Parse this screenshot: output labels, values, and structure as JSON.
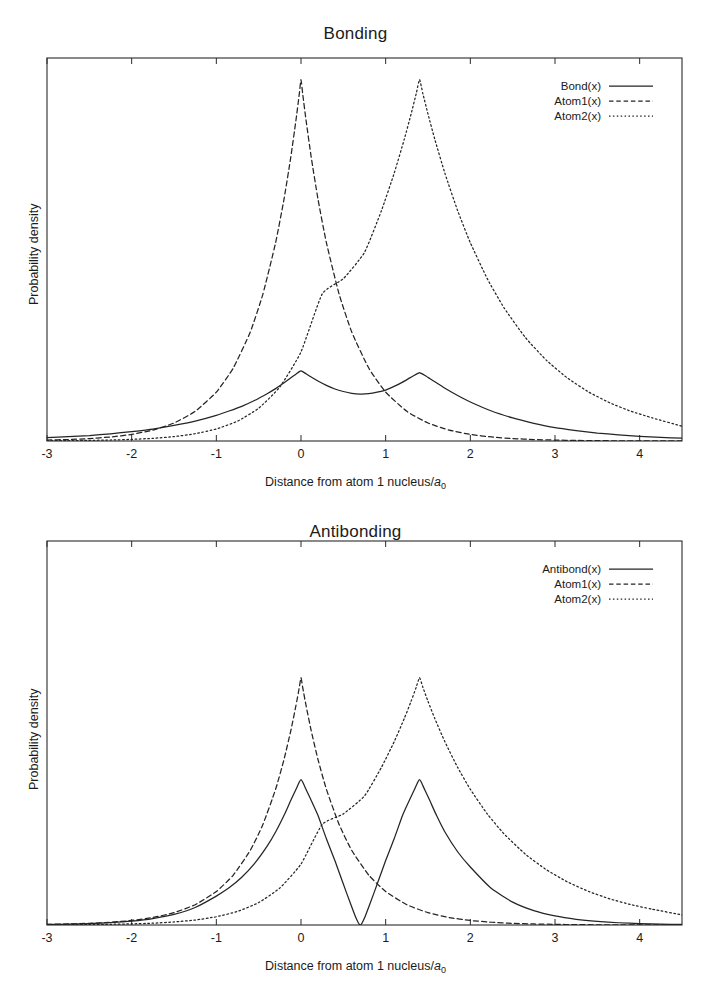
{
  "figures": [
    {
      "id": "bonding",
      "title": "Bonding",
      "xlabel_main": "Distance from atom 1 nucleus/",
      "xlabel_sym": "a",
      "xlabel_subscript": "0",
      "ylabel": "Probability density",
      "legend": [
        {
          "label": "Bond(x)",
          "style": "solid"
        },
        {
          "label": "Atom1(x)",
          "style": "dashed"
        },
        {
          "label": "Atom2(x)",
          "style": "dotted"
        }
      ]
    },
    {
      "id": "antibonding",
      "title": "Antibonding",
      "xlabel_main": "Distance from atom 1 nucleus/",
      "xlabel_sym": "a",
      "xlabel_subscript": "0",
      "ylabel": "Probability density",
      "legend": [
        {
          "label": "Antibond(x)",
          "style": "solid"
        },
        {
          "label": "Atom1(x)",
          "style": "dashed"
        },
        {
          "label": "Atom2(x)",
          "style": "dotted"
        }
      ]
    }
  ],
  "chart_data": [
    {
      "type": "line",
      "id": "bonding",
      "title": "Bonding",
      "xlabel": "Distance from atom 1 nucleus/a0",
      "ylabel": "Probability density",
      "grid": false,
      "legend_position": "top-right",
      "xlim": [
        -3.0,
        4.5
      ],
      "ylim": [
        0.0,
        1.06
      ],
      "xticks": [
        -3,
        -2,
        -1,
        0,
        1,
        2,
        3,
        4
      ],
      "xticklabels": [
        "-3",
        "-2",
        "-1",
        "0",
        "1",
        "2",
        "3",
        "4"
      ],
      "yticks": [],
      "yticklabels": [],
      "nucleus_positions": [
        0.0,
        1.4
      ],
      "decay_length_a0": 1.0,
      "description": "Squared sum of two 1s orbitals (bonding MO) compared with the individual atomic probability densities. Atom1 peaks at x=0, Atom2 peaks at x=1.4. The bonding curve shows two rounded maxima near the nuclei with filled-in electron density in the internuclear region (no node).",
      "series": [
        {
          "name": "Bond(x)",
          "style": "solid",
          "x": [
            -3.0,
            -2.75,
            -2.5,
            -2.25,
            -2.0,
            -1.75,
            -1.5,
            -1.25,
            -1.0,
            -0.85,
            -0.7,
            -0.55,
            -0.4,
            -0.3,
            -0.2,
            -0.12,
            -0.06,
            -0.02,
            0.0,
            0.02,
            0.06,
            0.12,
            0.2,
            0.3,
            0.4,
            0.5,
            0.6,
            0.7,
            0.8,
            0.9,
            1.0,
            1.1,
            1.2,
            1.28,
            1.34,
            1.38,
            1.4,
            1.42,
            1.46,
            1.52,
            1.6,
            1.7,
            1.85,
            2.0,
            2.25,
            2.5,
            2.75,
            3.0,
            3.25,
            3.5,
            3.75,
            4.0,
            4.25,
            4.5
          ],
          "y": [
            0.009,
            0.012,
            0.015,
            0.02,
            0.026,
            0.033,
            0.043,
            0.055,
            0.071,
            0.083,
            0.096,
            0.112,
            0.131,
            0.145,
            0.161,
            0.175,
            0.185,
            0.192,
            0.194,
            0.192,
            0.186,
            0.177,
            0.166,
            0.154,
            0.144,
            0.137,
            0.132,
            0.13,
            0.131,
            0.135,
            0.141,
            0.151,
            0.163,
            0.174,
            0.182,
            0.187,
            0.189,
            0.187,
            0.182,
            0.173,
            0.161,
            0.146,
            0.126,
            0.108,
            0.083,
            0.064,
            0.049,
            0.037,
            0.029,
            0.022,
            0.017,
            0.013,
            0.01,
            0.008
          ]
        },
        {
          "name": "Atom1(x)",
          "style": "dashed",
          "x": [
            -3.0,
            -2.75,
            -2.5,
            -2.25,
            -2.0,
            -1.75,
            -1.5,
            -1.25,
            -1.0,
            -0.8,
            -0.6,
            -0.45,
            -0.3,
            -0.2,
            -0.12,
            -0.06,
            -0.02,
            0.0,
            0.02,
            0.06,
            0.12,
            0.2,
            0.3,
            0.45,
            0.6,
            0.8,
            1.0,
            1.25,
            1.5,
            1.75,
            2.0,
            2.25,
            2.5,
            2.75,
            3.0,
            3.25,
            3.5,
            3.75,
            4.0,
            4.25,
            4.5
          ],
          "y": [
            0.0025,
            0.0041,
            0.0067,
            0.0111,
            0.0183,
            0.0302,
            0.0498,
            0.0821,
            0.1353,
            0.2019,
            0.3012,
            0.4066,
            0.5488,
            0.6703,
            0.7866,
            0.8869,
            0.9608,
            1.0,
            0.9608,
            0.8869,
            0.7866,
            0.6703,
            0.5488,
            0.4066,
            0.3012,
            0.2019,
            0.1353,
            0.0821,
            0.0498,
            0.0302,
            0.0183,
            0.0111,
            0.0067,
            0.0041,
            0.0025,
            0.0015,
            0.0009,
            0.0006,
            0.0003,
            0.0002,
            0.0001
          ]
        },
        {
          "name": "Atom2(x)",
          "style": "dotted",
          "x": [
            -3.0,
            -2.75,
            -2.5,
            -2.25,
            -2.0,
            -1.75,
            -1.5,
            -1.25,
            -1.0,
            -0.75,
            -0.5,
            -0.25,
            0.0,
            0.25,
            0.5,
            0.75,
            0.95,
            1.1,
            1.22,
            1.3,
            1.36,
            1.4,
            1.44,
            1.5,
            1.58,
            1.7,
            1.85,
            2.0,
            2.2,
            2.4,
            2.65,
            2.9,
            3.15,
            3.4,
            3.65,
            3.9,
            4.15,
            4.5
          ],
          "y": [
            0.0006,
            0.001,
            0.0017,
            0.0027,
            0.0045,
            0.0074,
            0.0122,
            0.0201,
            0.0334,
            0.055,
            0.0907,
            0.1496,
            0.2466,
            0.4066,
            0.4493,
            0.522,
            0.6376,
            0.7408,
            0.8353,
            0.9048,
            0.9608,
            1.0,
            0.9608,
            0.9048,
            0.8353,
            0.7408,
            0.6376,
            0.5488,
            0.4493,
            0.3679,
            0.2865,
            0.2231,
            0.1738,
            0.1353,
            0.1054,
            0.0821,
            0.0639,
            0.0408
          ]
        }
      ]
    },
    {
      "type": "line",
      "id": "antibonding",
      "title": "Antibonding",
      "xlabel": "Distance from atom 1 nucleus/a0",
      "ylabel": "Probability density",
      "grid": false,
      "legend_position": "top-right",
      "xlim": [
        -3.0,
        4.5
      ],
      "ylim": [
        0.0,
        1.06
      ],
      "xticks": [
        -3,
        -2,
        -1,
        0,
        1,
        2,
        3,
        4
      ],
      "xticklabels": [
        "-3",
        "-2",
        "-1",
        "0",
        "1",
        "2",
        "3",
        "4"
      ],
      "yticks": [],
      "yticklabels": [],
      "nucleus_positions": [
        0.0,
        1.4
      ],
      "node_position": 0.7,
      "decay_length_a0": 1.0,
      "description": "Squared difference of two 1s orbitals (antibonding MO). The solid curve rises above the atomic densities at both nuclei and falls to exactly zero at the nodal plane midway between the nuclei (x = 0.7).",
      "series": [
        {
          "name": "Antibond(x)",
          "style": "solid",
          "x": [
            -3.0,
            -2.75,
            -2.5,
            -2.25,
            -2.0,
            -1.75,
            -1.5,
            -1.25,
            -1.0,
            -0.85,
            -0.7,
            -0.55,
            -0.4,
            -0.3,
            -0.2,
            -0.12,
            -0.06,
            -0.02,
            0.0,
            0.02,
            0.06,
            0.12,
            0.2,
            0.3,
            0.4,
            0.5,
            0.58,
            0.64,
            0.68,
            0.7,
            0.72,
            0.76,
            0.82,
            0.9,
            1.0,
            1.1,
            1.2,
            1.28,
            1.34,
            1.38,
            1.4,
            1.42,
            1.46,
            1.52,
            1.6,
            1.7,
            1.85,
            2.0,
            2.25,
            2.5,
            2.75,
            3.0,
            3.25,
            3.5,
            3.75,
            4.0,
            4.25,
            4.5
          ],
          "y": [
            0.0015,
            0.0024,
            0.004,
            0.0066,
            0.0108,
            0.0178,
            0.0293,
            0.0484,
            0.0798,
            0.1025,
            0.1317,
            0.1692,
            0.2175,
            0.2566,
            0.3027,
            0.3442,
            0.374,
            0.3948,
            0.4013,
            0.3948,
            0.374,
            0.3442,
            0.3027,
            0.238,
            0.178,
            0.113,
            0.062,
            0.025,
            0.005,
            0.0,
            0.005,
            0.025,
            0.062,
            0.113,
            0.178,
            0.238,
            0.3027,
            0.3442,
            0.374,
            0.3948,
            0.4013,
            0.3948,
            0.374,
            0.3442,
            0.3027,
            0.2566,
            0.2022,
            0.16,
            0.1005,
            0.0632,
            0.0397,
            0.025,
            0.0157,
            0.0099,
            0.0062,
            0.0039,
            0.0025,
            0.0015
          ]
        },
        {
          "name": "Atom1(x)",
          "style": "dashed",
          "x": [
            -3.0,
            -2.75,
            -2.5,
            -2.25,
            -2.0,
            -1.75,
            -1.5,
            -1.25,
            -1.0,
            -0.8,
            -0.6,
            -0.45,
            -0.3,
            -0.2,
            -0.12,
            -0.06,
            -0.02,
            0.0,
            0.02,
            0.06,
            0.12,
            0.2,
            0.3,
            0.45,
            0.6,
            0.8,
            1.0,
            1.25,
            1.5,
            1.75,
            2.0,
            2.25,
            2.5,
            2.75,
            3.0,
            3.25,
            3.5,
            3.75,
            4.0,
            4.25,
            4.5
          ],
          "y": [
            0.0017,
            0.0028,
            0.0046,
            0.0076,
            0.0125,
            0.0206,
            0.034,
            0.056,
            0.0924,
            0.1378,
            0.2056,
            0.2775,
            0.3746,
            0.4575,
            0.5369,
            0.6053,
            0.6558,
            0.6826,
            0.6558,
            0.6053,
            0.5369,
            0.4575,
            0.3746,
            0.2775,
            0.2056,
            0.1378,
            0.0924,
            0.056,
            0.034,
            0.0206,
            0.0125,
            0.0076,
            0.0046,
            0.0028,
            0.0017,
            0.001,
            0.0006,
            0.0004,
            0.0002,
            0.0001,
            0.0001
          ]
        },
        {
          "name": "Atom2(x)",
          "style": "dotted",
          "x": [
            -3.0,
            -2.75,
            -2.5,
            -2.25,
            -2.0,
            -1.75,
            -1.5,
            -1.25,
            -1.0,
            -0.75,
            -0.5,
            -0.25,
            0.0,
            0.25,
            0.5,
            0.75,
            0.95,
            1.1,
            1.22,
            1.3,
            1.36,
            1.4,
            1.44,
            1.5,
            1.58,
            1.7,
            1.85,
            2.0,
            2.2,
            2.4,
            2.65,
            2.9,
            3.15,
            3.4,
            3.65,
            3.9,
            4.15,
            4.5
          ],
          "y": [
            0.0004,
            0.0007,
            0.0011,
            0.0019,
            0.0031,
            0.005,
            0.0083,
            0.0137,
            0.0228,
            0.0375,
            0.0619,
            0.1021,
            0.1683,
            0.2775,
            0.3067,
            0.3563,
            0.4352,
            0.5057,
            0.5701,
            0.6175,
            0.6558,
            0.6826,
            0.6558,
            0.6175,
            0.5701,
            0.5057,
            0.4352,
            0.3746,
            0.3067,
            0.2511,
            0.1955,
            0.1523,
            0.1186,
            0.0924,
            0.0719,
            0.056,
            0.0436,
            0.0278
          ]
        }
      ]
    }
  ]
}
